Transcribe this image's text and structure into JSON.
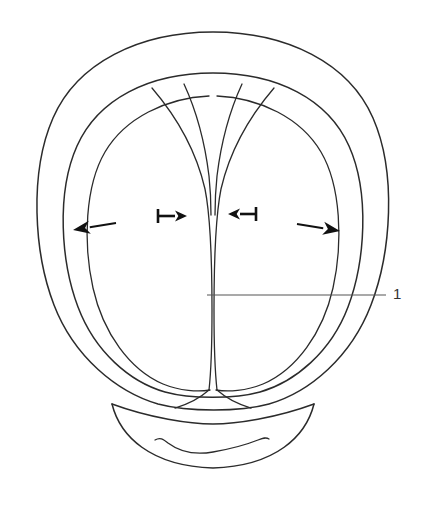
{
  "figure": {
    "domain": "diagram",
    "background_color": "#ffffff",
    "line_color": "#2b2b2b",
    "arrow_color": "#111111",
    "leader_color": "#555555",
    "label_color": "#333333",
    "width": 423,
    "height": 507
  },
  "callouts": [
    {
      "id": "callout-1",
      "label": "1",
      "label_x": 393,
      "label_y": 286,
      "leader_from_x": 207,
      "leader_from_y": 295,
      "leader_to_x": 386,
      "leader_to_y": 295,
      "points_to": "central-cleft"
    }
  ],
  "arrows": [
    {
      "id": "arrow-outward-left",
      "name": "large-left-arrow",
      "direction": "left",
      "has_tail_bar": false,
      "tip_x": 73,
      "tip_y": 230,
      "tail_x": 116,
      "tail_y": 223
    },
    {
      "id": "arrow-inward-left",
      "name": "small-right-arrow-with-bar",
      "direction": "right",
      "has_tail_bar": true,
      "tip_x": 187,
      "tip_y": 216,
      "tail_x": 158,
      "tail_y": 216
    },
    {
      "id": "arrow-inward-right",
      "name": "small-left-arrow-with-bar",
      "direction": "left",
      "has_tail_bar": true,
      "tip_x": 228,
      "tip_y": 214,
      "tail_x": 256,
      "tail_y": 214
    },
    {
      "id": "arrow-outward-right",
      "name": "large-right-arrow",
      "direction": "right",
      "has_tail_bar": false,
      "tip_x": 340,
      "tip_y": 231,
      "tail_x": 297,
      "tail_y": 224
    }
  ],
  "outlines": {
    "outer_ring": "M 213 32 C 287 32 349 63 373 118 C 397 173 391 253 371 305 C 351 357 310 392 269 404 C 240 412 188 412 158 404 C 117 392 74 357 54 305 C 34 253 29 173 53 118 C 77 63 139 32 213 32 Z",
    "inner_ring": "M 213 73 C 277 73 328 99 349 146 C 370 193 365 262 348 307 C 331 352 295 382 260 392 C 235 399 190 399 165 392 C 130 382 95 352 78 307 C 61 262 56 193 77 146 C 98 99 149 73 213 73 Z",
    "lobe_left_outer": "M 209 96 C 166 98 125 118 105 152 C 85 186 83 243 93 288 C 103 333 130 370 163 384 C 180 391 198 392 210 390",
    "lobe_right_outer": "M 217 96 C 260 98 301 118 321 152 C 341 186 343 243 333 288 C 323 333 296 370 263 384 C 246 391 228 392 216 390",
    "cleft_left": "M 152 88 C 176 116 196 150 205 189 C 211 219 212 265 212 310 C 212 345 211 372 209 390",
    "cleft_right": "M 274 88 C 250 116 230 150 221 189 C 215 219 214 265 214 310 C 214 345 215 372 217 390",
    "cleft_inner_left": "M 184 84 C 196 110 205 143 209 176 C 211 195 211 205 211 215",
    "cleft_inner_right": "M 242 84 C 230 110 221 143 217 176 C 215 195 215 205 215 215",
    "lobe_bottom_left": "M 209 390 C 200 398 189 404 175 408",
    "lobe_bottom_right": "M 217 390 C 226 398 237 404 251 408",
    "neck_arc": "M 112 404 C 150 418 190 424 213 424 C 236 424 276 418 314 404",
    "chin_outer": "M 112 404 C 120 436 150 466 213 468 C 276 466 306 436 314 404",
    "chin_wave": "M 155 440 C 160 437 163 439 168 443 C 180 452 196 455 213 452 C 230 449 248 444 258 440 C 263 438 266 437 269 439"
  }
}
